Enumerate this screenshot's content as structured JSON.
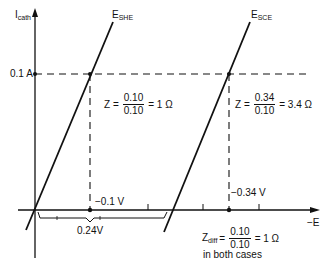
{
  "axes": {
    "y_label_main": "I",
    "y_label_sub": "cath",
    "x_label": "−E",
    "current_level": "0.1 A"
  },
  "curves": {
    "she": {
      "label_main": "E",
      "label_sub": "SHE"
    },
    "sce": {
      "label_main": "E",
      "label_sub": "SCE"
    }
  },
  "annotations": {
    "z_she": {
      "prefix": "Z =",
      "numerator": "0.10",
      "denominator": "0.10",
      "result": "= 1 Ω"
    },
    "z_sce": {
      "prefix": "Z =",
      "numerator": "0.34",
      "denominator": "0.10",
      "result": "= 3.4 Ω"
    },
    "v_she": "−0.1 V",
    "v_sce": "−0.34 V",
    "offset": "0.24V",
    "z_diff": {
      "prefix_main": "Z",
      "prefix_sub": "diff",
      "eq": "=",
      "numerator": "0.10",
      "denominator": "0.10",
      "result": "= 1 Ω",
      "note": "in both cases"
    }
  },
  "colors": {
    "ink": "#111111",
    "background": "#ffffff"
  }
}
